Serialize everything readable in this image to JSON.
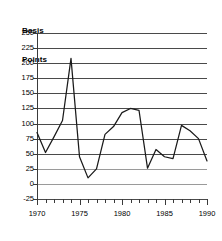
{
  "chart_data": {
    "type": "line",
    "title": "Basis Points",
    "title_lines": [
      "Basis",
      "Points"
    ],
    "xlabel": "",
    "ylabel": "Basis Points",
    "xlim": [
      1970,
      1990
    ],
    "ylim": [
      -25,
      250
    ],
    "grid": true,
    "legend": "none",
    "ytick_labels": [
      "250",
      "225",
      "200",
      "175",
      "150",
      "125",
      "100",
      "75",
      "50",
      "25",
      "0",
      "-25"
    ],
    "ytick_values": [
      250,
      225,
      200,
      175,
      150,
      125,
      100,
      75,
      50,
      25,
      0,
      -25
    ],
    "xtick_labels": [
      "1970",
      "1975",
      "1980",
      "1985",
      "1990"
    ],
    "xtick_values": [
      1970,
      1975,
      1980,
      1985,
      1990
    ],
    "x_minor_ticks": [
      1970,
      1971,
      1972,
      1973,
      1974,
      1975,
      1976,
      1977,
      1978,
      1979,
      1980,
      1981,
      1982,
      1983,
      1984,
      1985,
      1986,
      1987,
      1988,
      1989,
      1990
    ],
    "x": [
      1970,
      1971,
      1972,
      1973,
      1974,
      1975,
      1976,
      1977,
      1978,
      1979,
      1980,
      1981,
      1982,
      1983,
      1984,
      1985,
      1986,
      1987,
      1988,
      1989,
      1990
    ],
    "values": [
      85,
      52,
      78,
      105,
      208,
      45,
      10,
      25,
      82,
      95,
      118,
      125,
      122,
      26,
      57,
      45,
      42,
      97,
      88,
      75,
      38
    ],
    "series": [
      {
        "name": "Basis Points",
        "color": "#1a1a1a",
        "values": [
          85,
          52,
          78,
          105,
          208,
          45,
          10,
          25,
          82,
          95,
          118,
          125,
          122,
          26,
          57,
          45,
          42,
          97,
          88,
          75,
          38
        ]
      }
    ],
    "annotations": []
  },
  "colors": {
    "line": "#1a1a1a",
    "grid": "#4a4a4a",
    "grid_light": "#9a9a9a",
    "axis": "#3a3a3a",
    "background": "#ffffff",
    "text": "#000000"
  }
}
